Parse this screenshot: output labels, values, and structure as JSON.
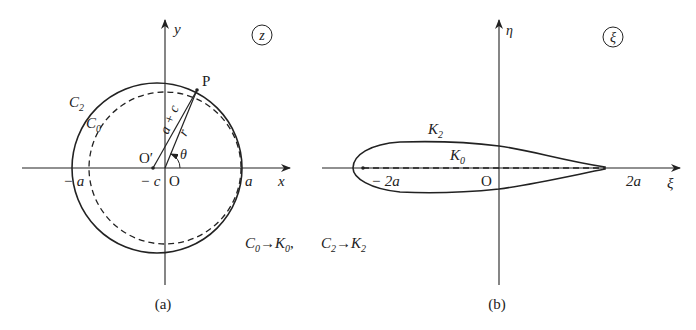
{
  "panel_a": {
    "plane_label": "z",
    "x_axis_label": "x",
    "y_axis_label": "y",
    "point_P": "P",
    "origin": "O",
    "origin_shifted": "O′",
    "circle_outer": "C",
    "circle_outer_sub": "2",
    "circle_inner": "C",
    "circle_inner_sub": "0",
    "radius_label": "a + c",
    "r_label": "r",
    "theta_label": "θ",
    "tick_neg_a": "− a",
    "tick_neg_c": "− c",
    "tick_a": "a",
    "caption": "(a)"
  },
  "panel_b": {
    "plane_label": "ξ",
    "x_axis_label": "ξ",
    "y_axis_label": "η",
    "origin": "O",
    "airfoil_label": "K",
    "airfoil_sub": "2",
    "segment_label": "K",
    "segment_sub": "0",
    "tick_neg_2a": "− 2a",
    "tick_2a": "2a",
    "caption": "(b)"
  },
  "mapping": {
    "m1_from": "C",
    "m1_from_sub": "0",
    "m1_to": "K",
    "m1_to_sub": "0",
    "separator": ",",
    "m2_from": "C",
    "m2_from_sub": "2",
    "m2_to": "K",
    "m2_to_sub": "2"
  }
}
